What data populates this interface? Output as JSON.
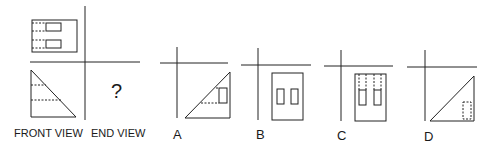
{
  "question": {
    "front_view_label": "FRONT VIEW",
    "end_view_label": "END VIEW",
    "unknown_mark": "?"
  },
  "options": [
    {
      "letter": "A"
    },
    {
      "letter": "B"
    },
    {
      "letter": "C"
    },
    {
      "letter": "D"
    }
  ]
}
